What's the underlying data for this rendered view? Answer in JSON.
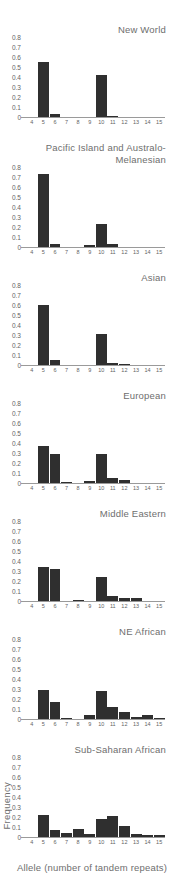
{
  "figure": {
    "ylabel": "Frequency",
    "xlabel": "Allele (number of tandem repeats)",
    "yticks": [
      "0",
      "0.1",
      "0.2",
      "0.3",
      "0.4",
      "0.5",
      "0.6",
      "0.7",
      "0.8"
    ],
    "colors": {
      "bar": "#2f2f2f",
      "axis": "#9a9a9a",
      "text": "#6a6a6a"
    }
  },
  "chart_data": [
    {
      "type": "bar",
      "title": "New World",
      "categories": [
        4,
        5,
        6,
        7,
        8,
        9,
        10,
        11,
        12,
        13,
        14,
        15
      ],
      "values": [
        0,
        0.55,
        0.03,
        0,
        0,
        0,
        0.42,
        0.01,
        0,
        0,
        0,
        0
      ],
      "xlabel": "Allele (number of tandem repeats)",
      "ylabel": "Frequency",
      "ylim": [
        0,
        0.8
      ]
    },
    {
      "type": "bar",
      "title": "Pacific Island and Australo-Melanesian",
      "categories": [
        4,
        5,
        6,
        7,
        8,
        9,
        10,
        11,
        12,
        13,
        14,
        15
      ],
      "values": [
        0,
        0.73,
        0.03,
        0,
        0,
        0.02,
        0.23,
        0.03,
        0,
        0,
        0,
        0
      ],
      "xlabel": "Allele (number of tandem repeats)",
      "ylabel": "Frequency",
      "ylim": [
        0,
        0.8
      ]
    },
    {
      "type": "bar",
      "title": "Asian",
      "categories": [
        4,
        5,
        6,
        7,
        8,
        9,
        10,
        11,
        12,
        13,
        14,
        15
      ],
      "values": [
        0,
        0.6,
        0.05,
        0,
        0,
        0,
        0.31,
        0.02,
        0.01,
        0,
        0,
        0
      ],
      "xlabel": "Allele (number of tandem repeats)",
      "ylabel": "Frequency",
      "ylim": [
        0,
        0.8
      ]
    },
    {
      "type": "bar",
      "title": "European",
      "categories": [
        4,
        5,
        6,
        7,
        8,
        9,
        10,
        11,
        12,
        13,
        14,
        15
      ],
      "values": [
        0,
        0.37,
        0.29,
        0.01,
        0,
        0.02,
        0.29,
        0.05,
        0.03,
        0,
        0,
        0
      ],
      "xlabel": "Allele (number of tandem repeats)",
      "ylabel": "Frequency",
      "ylim": [
        0,
        0.8
      ]
    },
    {
      "type": "bar",
      "title": "Middle Eastern",
      "categories": [
        4,
        5,
        6,
        7,
        8,
        9,
        10,
        11,
        12,
        13,
        14,
        15
      ],
      "values": [
        0,
        0.34,
        0.32,
        0,
        0.01,
        0,
        0.24,
        0.05,
        0.03,
        0.03,
        0,
        0
      ],
      "xlabel": "Allele (number of tandem repeats)",
      "ylabel": "Frequency",
      "ylim": [
        0,
        0.8
      ]
    },
    {
      "type": "bar",
      "title": "NE African",
      "categories": [
        4,
        5,
        6,
        7,
        8,
        9,
        10,
        11,
        12,
        13,
        14,
        15
      ],
      "values": [
        0,
        0.29,
        0.17,
        0.01,
        0,
        0.04,
        0.28,
        0.12,
        0.07,
        0.02,
        0.04,
        0.01
      ],
      "xlabel": "Allele (number of tandem repeats)",
      "ylabel": "Frequency",
      "ylim": [
        0,
        0.8
      ]
    },
    {
      "type": "bar",
      "title": "Sub-Saharan African",
      "categories": [
        4,
        5,
        6,
        7,
        8,
        9,
        10,
        11,
        12,
        13,
        14,
        15
      ],
      "values": [
        0,
        0.22,
        0.07,
        0.04,
        0.08,
        0.03,
        0.18,
        0.21,
        0.11,
        0.03,
        0.02,
        0.02
      ],
      "xlabel": "Allele (number of tandem repeats)",
      "ylabel": "Frequency",
      "ylim": [
        0,
        0.8
      ]
    }
  ]
}
